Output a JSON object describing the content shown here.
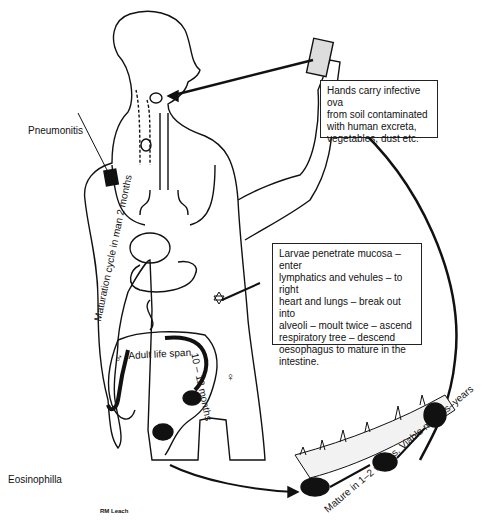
{
  "diagram": {
    "type": "life-cycle illustration",
    "labels": {
      "pneumonitis": "Pneumonitis",
      "eosinophilia": "Eosinophilla",
      "maturation_cycle": "Maturation cycle in man 2 months",
      "adult_life_span": "Adult life span",
      "life_span_duration": "10 – 12 months",
      "soil_maturation": "Mature in 1–2 weeks. Viable months–years",
      "signature": "RM Leach",
      "male_symbol": "♂",
      "female_symbol": "♀"
    },
    "callouts": {
      "hands": "Hands carry infective ova\nfrom soil contaminated\nwith human excreta,\nvegetables, dust etc.",
      "larvae": "Larvae penetrate mucosa – enter\nlymphatics and vehules – to right\nheart and lungs – break out into\nalveoli – moult twice – ascend\nrespiratory tree – descend\noesophagus to mature in the\nintestine."
    },
    "colors": {
      "ink": "#111111",
      "background": "#ffffff"
    }
  }
}
